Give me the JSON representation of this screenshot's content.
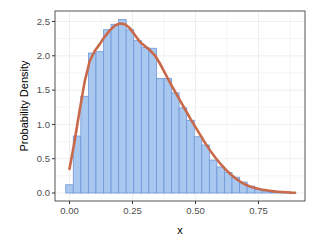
{
  "chart_data": {
    "type": "bar",
    "subtype": "histogram_with_density",
    "title": "",
    "xlabel": "x",
    "ylabel": "Probability Density",
    "xlim": [
      -0.04,
      0.93
    ],
    "ylim": [
      -0.11,
      2.63
    ],
    "x_ticks": [
      0.0,
      0.25,
      0.5,
      0.75
    ],
    "x_tick_labels": [
      "0.00",
      "0.25",
      "0.50",
      "0.75"
    ],
    "y_ticks": [
      0.0,
      0.5,
      1.0,
      1.5,
      2.0,
      2.5
    ],
    "y_tick_labels": [
      "0.0",
      "0.5",
      "1.0",
      "1.5",
      "2.0",
      "2.5"
    ],
    "grid": true,
    "legend": null,
    "bin_width": 0.03,
    "bin_centers": [
      0.0,
      0.03,
      0.06,
      0.09,
      0.12,
      0.15,
      0.18,
      0.21,
      0.24,
      0.27,
      0.3,
      0.33,
      0.36,
      0.39,
      0.42,
      0.45,
      0.48,
      0.51,
      0.54,
      0.57,
      0.6,
      0.63,
      0.66,
      0.69,
      0.72,
      0.75,
      0.78,
      0.81,
      0.84,
      0.87
    ],
    "values": [
      0.12,
      0.83,
      1.41,
      2.04,
      2.06,
      2.38,
      2.46,
      2.53,
      2.38,
      2.22,
      2.12,
      2.11,
      1.67,
      1.67,
      1.46,
      1.24,
      1.06,
      0.82,
      0.7,
      0.48,
      0.38,
      0.3,
      0.23,
      0.16,
      0.1,
      0.05,
      0.03,
      0.01,
      0.005,
      0.002
    ],
    "density_curve": {
      "x": [
        0.0,
        0.02,
        0.04,
        0.06,
        0.08,
        0.1,
        0.12,
        0.14,
        0.16,
        0.18,
        0.2,
        0.22,
        0.24,
        0.26,
        0.28,
        0.3,
        0.32,
        0.34,
        0.36,
        0.38,
        0.4,
        0.42,
        0.44,
        0.46,
        0.48,
        0.5,
        0.52,
        0.54,
        0.56,
        0.58,
        0.6,
        0.62,
        0.64,
        0.66,
        0.68,
        0.7,
        0.72,
        0.74,
        0.76,
        0.78,
        0.8,
        0.82,
        0.84,
        0.86,
        0.88,
        0.895
      ],
      "y": [
        0.35,
        0.75,
        1.2,
        1.62,
        1.92,
        2.07,
        2.17,
        2.28,
        2.37,
        2.44,
        2.47,
        2.46,
        2.4,
        2.3,
        2.2,
        2.14,
        2.08,
        2.0,
        1.88,
        1.74,
        1.6,
        1.47,
        1.34,
        1.21,
        1.08,
        0.96,
        0.84,
        0.72,
        0.61,
        0.51,
        0.42,
        0.34,
        0.27,
        0.21,
        0.16,
        0.12,
        0.09,
        0.07,
        0.05,
        0.04,
        0.03,
        0.02,
        0.015,
        0.01,
        0.005,
        0.003
      ]
    },
    "colors": {
      "bar_fill": "#a9c8f0",
      "bar_edge": "#6e96d8",
      "curve": "#c8694b",
      "panel_border": "#555555",
      "grid": "#ebebeb",
      "text": "#4d4d4d"
    }
  }
}
